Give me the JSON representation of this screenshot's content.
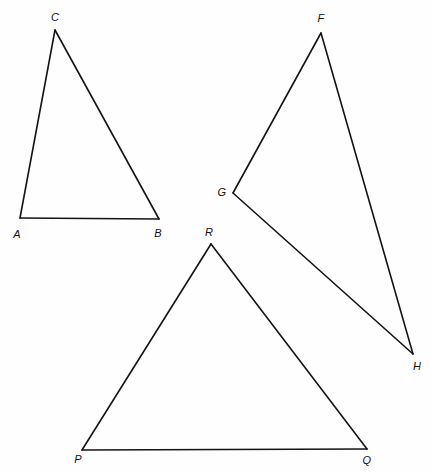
{
  "figure": {
    "name": "three-triangles-figure",
    "width": 430,
    "height": 474,
    "background_color": "#fefefe",
    "stroke_color": "#141414",
    "stroke_width": 1.6,
    "label_color": "#121212",
    "label_font_size": 11,
    "label_style": "italic"
  },
  "shapes": [
    {
      "id": "triangle-abc",
      "name": "triangle-abc",
      "vertices": [
        {
          "label": "A",
          "x": 20,
          "y": 218
        },
        {
          "label": "B",
          "x": 159,
          "y": 219
        },
        {
          "label": "C",
          "x": 55,
          "y": 30
        }
      ],
      "edges": [
        {
          "from": "A",
          "to": "B"
        },
        {
          "from": "B",
          "to": "C"
        },
        {
          "from": "C",
          "to": "A"
        }
      ]
    },
    {
      "id": "triangle-fgh",
      "name": "triangle-fgh",
      "vertices": [
        {
          "label": "F",
          "x": 321,
          "y": 33
        },
        {
          "label": "G",
          "x": 233,
          "y": 193
        },
        {
          "label": "H",
          "x": 413,
          "y": 354
        }
      ],
      "edges": [
        {
          "from": "F",
          "to": "G"
        },
        {
          "from": "G",
          "to": "H"
        },
        {
          "from": "H",
          "to": "F"
        }
      ]
    },
    {
      "id": "triangle-pqr",
      "name": "triangle-pqr",
      "vertices": [
        {
          "label": "P",
          "x": 82,
          "y": 450
        },
        {
          "label": "Q",
          "x": 367,
          "y": 449
        },
        {
          "label": "R",
          "x": 211,
          "y": 244
        }
      ],
      "edges": [
        {
          "from": "P",
          "to": "Q"
        },
        {
          "from": "Q",
          "to": "R"
        },
        {
          "from": "R",
          "to": "P"
        }
      ]
    }
  ],
  "labels": [
    {
      "id": "label-a",
      "text": "A",
      "x": 17,
      "y": 234
    },
    {
      "id": "label-b",
      "text": "B",
      "x": 158,
      "y": 233
    },
    {
      "id": "label-c",
      "text": "C",
      "x": 55,
      "y": 17
    },
    {
      "id": "label-f",
      "text": "F",
      "x": 321,
      "y": 18
    },
    {
      "id": "label-g",
      "text": "G",
      "x": 222,
      "y": 192
    },
    {
      "id": "label-h",
      "text": "H",
      "x": 417,
      "y": 366
    },
    {
      "id": "label-p",
      "text": "P",
      "x": 78,
      "y": 459
    },
    {
      "id": "label-q",
      "text": "Q",
      "x": 367,
      "y": 460
    },
    {
      "id": "label-r",
      "text": "R",
      "x": 209,
      "y": 232
    }
  ]
}
